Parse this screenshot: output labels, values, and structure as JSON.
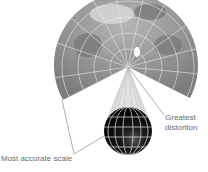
{
  "diagram": {
    "labels": {
      "greatest_distortion_line1": "Greatest",
      "greatest_distortion_line2": "distortion",
      "most_accurate": "Most accurate scale"
    },
    "colors": {
      "map_fill": "#8c8c8c",
      "graticule": "#e8e8e8",
      "globe": "#111111",
      "leader": "#777777",
      "text": "#6a6a6a"
    }
  }
}
